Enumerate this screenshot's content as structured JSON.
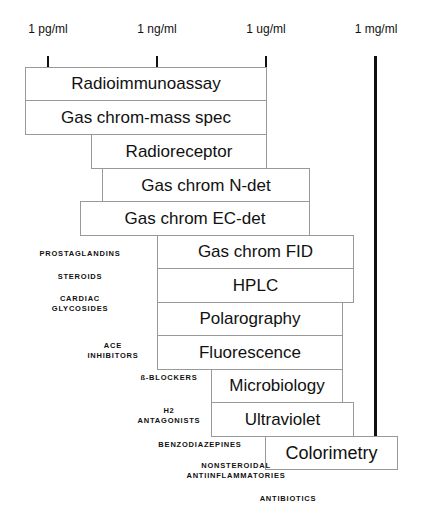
{
  "axis": {
    "labels": [
      "1 pg/ml",
      "1 ng/ml",
      "1 ug/ml",
      "1 mg/ml"
    ]
  },
  "methods": [
    {
      "label": "Radioimmunoassay"
    },
    {
      "label": "Gas chrom-mass spec"
    },
    {
      "label": "Radioreceptor"
    },
    {
      "label": "Gas chrom N-det"
    },
    {
      "label": "Gas chrom EC-det"
    },
    {
      "label": "Gas chrom FID"
    },
    {
      "label": "HPLC"
    },
    {
      "label": "Polarography"
    },
    {
      "label": "Fluorescence"
    },
    {
      "label": "Microbiology"
    },
    {
      "label": "Ultraviolet"
    },
    {
      "label": "Colorimetry"
    }
  ],
  "drug_classes": [
    {
      "label": "PROSTAGLANDINS"
    },
    {
      "label": "STEROIDS"
    },
    {
      "label": "CARDIAC\nGLYCOSIDES"
    },
    {
      "label": "ACE\nINHIBITORS"
    },
    {
      "label": "ß-BLOCKERS"
    },
    {
      "label": "H2\nANTAGONISTS"
    },
    {
      "label": "BENZODIAZEPINES"
    },
    {
      "label": "NONSTEROIDAL\nANTIINFLAMMATORIES"
    },
    {
      "label": "ANTIBIOTICS"
    }
  ]
}
